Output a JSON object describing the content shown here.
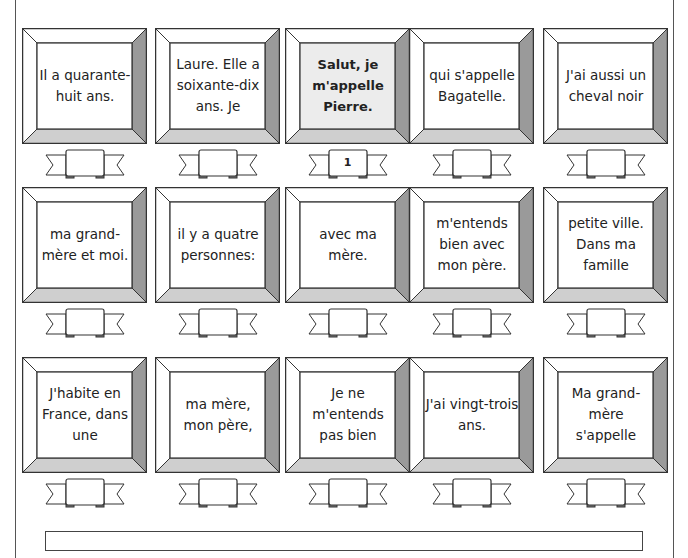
{
  "worksheet": {
    "cards": [
      {
        "text": "Il a quarante-huit ans.",
        "number": ""
      },
      {
        "text": "Laure. Elle a soixante-dix ans. Je",
        "number": ""
      },
      {
        "text": "Salut, je m'appelle Pierre.",
        "number": "1",
        "highlighted": true
      },
      {
        "text": "qui s'appelle Bagatelle.",
        "number": ""
      },
      {
        "text": "J'ai aussi un cheval noir",
        "number": ""
      },
      {
        "text": "ma grand-mère et moi.",
        "number": ""
      },
      {
        "text": "il y a quatre personnes:",
        "number": ""
      },
      {
        "text": "avec ma mère.",
        "number": ""
      },
      {
        "text": "m'entends bien avec mon père.",
        "number": ""
      },
      {
        "text": "petite ville. Dans ma famille",
        "number": ""
      },
      {
        "text": "J'habite en France, dans une",
        "number": ""
      },
      {
        "text": "ma mère, mon père,",
        "number": ""
      },
      {
        "text": "Je ne m'entends pas bien",
        "number": ""
      },
      {
        "text": "J'ai vingt-trois ans.",
        "number": ""
      },
      {
        "text": "Ma grand-mère s'appelle",
        "number": ""
      }
    ],
    "colors": {
      "frame_right": "#9a9a9a",
      "frame_bottom": "#cfcfcf",
      "frame_top_left": "#ffffff",
      "highlight_fill": "#ececec",
      "line": "#333333"
    }
  }
}
